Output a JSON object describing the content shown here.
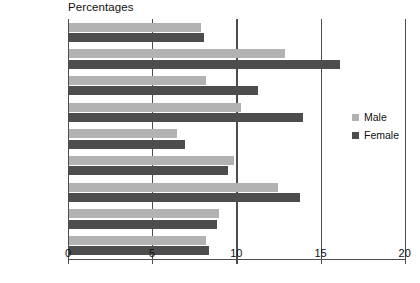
{
  "chart_data": {
    "type": "bar",
    "orientation": "horizontal",
    "title": "Percentages",
    "xlabel": "",
    "ylabel": "",
    "xlim": [
      0,
      20
    ],
    "xticks": [
      0,
      5,
      10,
      15,
      20
    ],
    "xtick_labels": [
      "0",
      "5",
      "10",
      "15",
      "20"
    ],
    "grid": true,
    "legend_position": "right",
    "categories": [
      "Christian",
      "Muslim",
      "Hindu",
      "Sikh",
      "Jewish",
      "Buddhist",
      "Other",
      "No religion",
      "Total"
    ],
    "series": [
      {
        "name": "Male",
        "color": "#b2b2b2",
        "values": [
          7.8,
          12.8,
          8.1,
          10.2,
          6.4,
          9.8,
          12.4,
          8.9,
          8.1
        ]
      },
      {
        "name": "Female",
        "color": "#4d4d4d",
        "values": [
          8.0,
          16.1,
          11.2,
          13.9,
          6.9,
          9.4,
          13.7,
          8.8,
          8.3
        ]
      }
    ]
  },
  "legend": {
    "items": [
      {
        "label": "Male",
        "swatch": "male"
      },
      {
        "label": "Female",
        "swatch": "female"
      }
    ]
  },
  "colors": {
    "male": "#b2b2b2",
    "female": "#4d4d4d",
    "axis": "#4d4d4d",
    "text": "#111111",
    "background": "#ffffff"
  }
}
